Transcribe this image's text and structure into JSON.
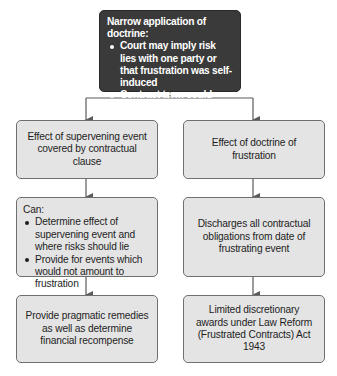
{
  "diagram": {
    "top": {
      "heading": "Narrow application of doctrine:",
      "bullets": [
        "Court may imply risk lies with one party or that frustration was self-induced",
        "Contract term could allow parties to determine effect"
      ]
    },
    "left": {
      "row1": "Effect of supervening event covered by contractual clause",
      "row2": {
        "heading": "Can:",
        "bullets": [
          "Determine effect of supervening event and where risks should lie",
          "Provide for events which would not amount to frustration"
        ]
      },
      "row3": "Provide pragmatic remedies as well as determine financial recompense"
    },
    "right": {
      "row1": "Effect of doctrine of frustration",
      "row2": "Discharges all contractual obligations from date of frustrating event",
      "row3": "Limited discretionary awards under Law Reform (Frustrated Contracts) Act 1943"
    },
    "colors": {
      "top_box_fill": "#3a3a3a",
      "box_fill": "#e4e4e4",
      "box_border": "#6f6f6f",
      "connector": "#5a5a5a"
    }
  }
}
